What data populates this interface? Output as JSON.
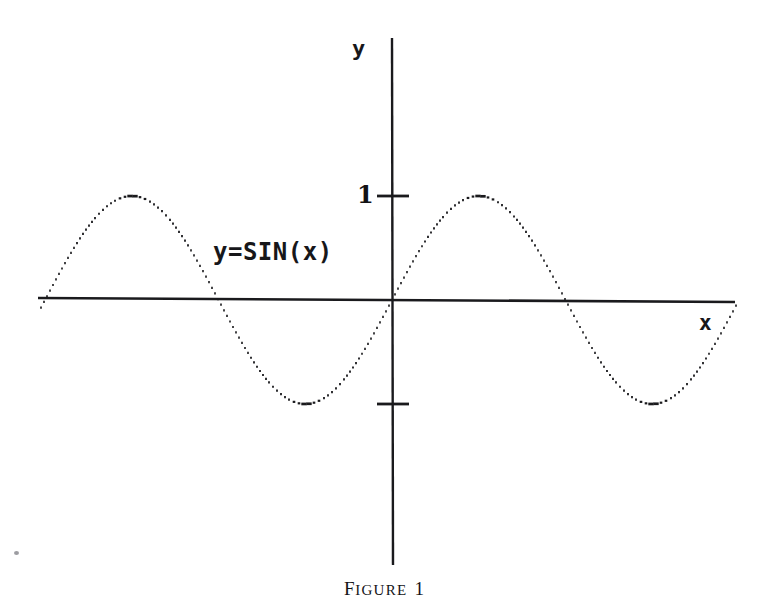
{
  "figure": {
    "caption_lead": "F",
    "caption_small": "IGURE",
    "caption_number": "1",
    "background_color": "#ffffff",
    "ink_color": "#1a1a1d"
  },
  "labels": {
    "y_axis": "y",
    "x_axis": "x",
    "tick_one": "1",
    "equation": "y=SIN(x)"
  },
  "chart_data": {
    "type": "line",
    "title": "",
    "subtitle": "",
    "xlabel": "x",
    "ylabel": "y",
    "annotations": [
      {
        "text": "y=SIN(x)",
        "x_px": 213,
        "y_px": 240
      }
    ],
    "legend": [],
    "legend_position": "none",
    "grid": false,
    "series": [
      {
        "name": "y=SIN(x)",
        "style": "dotted",
        "color": "#1a1a1d",
        "formula": "y = sin(x)",
        "x": [
          -6.283185,
          -5.890486,
          -5.497787,
          -5.105088,
          -4.712389,
          -4.31969,
          -3.926991,
          -3.534292,
          -3.141593,
          -2.748894,
          -2.356194,
          -1.963495,
          -1.570796,
          -1.178097,
          -0.785398,
          -0.392699,
          0.0,
          0.392699,
          0.785398,
          1.178097,
          1.570796,
          1.963495,
          2.356194,
          2.748894,
          3.141593,
          3.534292,
          3.926991,
          4.31969,
          4.712389,
          5.105088,
          5.497787,
          5.890486,
          6.283185,
          6.675884,
          7.068583
        ],
        "y": [
          0.0,
          0.38268,
          0.70711,
          0.92388,
          1.0,
          0.92388,
          0.70711,
          0.38268,
          0.0,
          -0.38268,
          -0.70711,
          -0.92388,
          -1.0,
          -0.92388,
          -0.70711,
          -0.38268,
          0.0,
          0.38268,
          0.70711,
          0.92388,
          1.0,
          0.92388,
          0.70711,
          0.38268,
          0.0,
          -0.38268,
          -0.70711,
          -0.92388,
          -1.0,
          -0.92388,
          -0.70711,
          -0.38268,
          0.0,
          0.38268,
          0.70711
        ]
      }
    ],
    "xlim": [
      -6.4,
      6.2
    ],
    "ylim": [
      -1.25,
      1.55
    ],
    "x_ticks": [],
    "x_tick_labels": [],
    "y_ticks": [
      1,
      -1
    ],
    "y_tick_labels": [
      "1",
      ""
    ],
    "zero_crossings_px": [
      218,
      392,
      565
    ],
    "peaks_px": [
      131,
      478
    ],
    "troughs_px": [
      305,
      652
    ],
    "amplitude_px": 104,
    "period_px": 347,
    "origin_px": {
      "x": 392,
      "y": 300
    }
  }
}
